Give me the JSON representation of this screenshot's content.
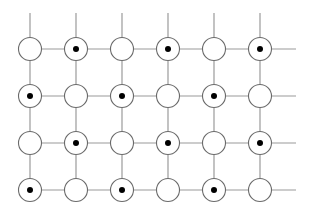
{
  "diagram": {
    "type": "lattice-grid",
    "rows": 4,
    "cols": 6,
    "col_x": [
      30,
      76,
      122,
      168,
      214,
      260
    ],
    "row_y": [
      49,
      96,
      143,
      190
    ],
    "circle_radius": 11.5,
    "dot_radius": 3,
    "line_top_y": 13,
    "line_right_x": 296,
    "colors": {
      "line": "#9a9a9a",
      "circle_stroke": "#6a6a6a",
      "circle_fill": "#ffffff",
      "dot": "#000000"
    },
    "nodes": [
      [
        0,
        1,
        0,
        1,
        0,
        1
      ],
      [
        1,
        0,
        1,
        0,
        1,
        0
      ],
      [
        0,
        1,
        0,
        1,
        0,
        1
      ],
      [
        1,
        0,
        1,
        0,
        1,
        0
      ]
    ]
  }
}
